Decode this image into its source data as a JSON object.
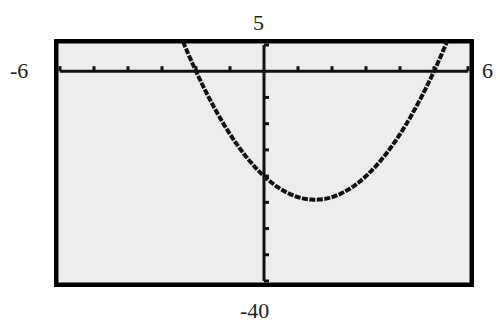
{
  "window": {
    "xmin": "-6",
    "xmax": "6",
    "ymin": "-40",
    "ymax": "5"
  },
  "chart_data": {
    "type": "line",
    "title": "",
    "xlabel": "",
    "ylabel": "",
    "xlim": [
      -6,
      6
    ],
    "ylim": [
      -40,
      5
    ],
    "x_ticks_step": 1,
    "y_ticks_step": 5,
    "grid": false,
    "series": [
      {
        "name": "parabola",
        "x": [
          -2.2,
          -2,
          -1,
          0,
          1,
          1.5,
          2,
          3,
          4,
          5,
          5.3
        ],
        "y": [
          5,
          0,
          -12,
          -20,
          -24,
          -24.5,
          -24,
          -20,
          -12,
          0,
          4.5
        ]
      }
    ],
    "x_intercepts": [
      -2,
      5
    ],
    "y_intercept": -20,
    "vertex": [
      1.5,
      -24.5
    ]
  },
  "colors": {
    "screen": "#ededed",
    "ink": "#111111",
    "frame": "#000000"
  }
}
